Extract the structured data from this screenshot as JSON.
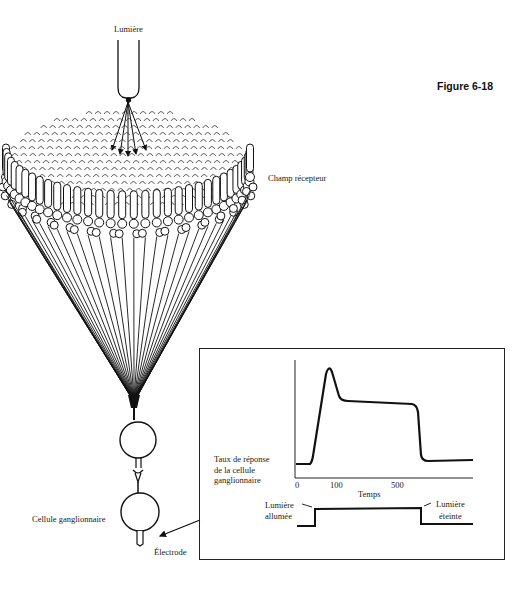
{
  "figure": {
    "number_label": "Figure 6-18"
  },
  "diagram": {
    "light_source_label": "Lumière",
    "receptive_field_label": "Champ récepteur",
    "ganglion_cell_label": "Cellule ganglionnaire",
    "electrode_label": "Électrode"
  },
  "inset_graph": {
    "y_label_lines": [
      "Taux de réponse",
      "de la cellule",
      "ganglionnaire"
    ],
    "x_label": "Temps",
    "x_ticks": [
      "0",
      "100",
      "500"
    ],
    "light_on_label_lines": [
      "Lumière",
      "allumée"
    ],
    "light_off_label_lines": [
      "Lumière",
      "éteinte"
    ]
  },
  "chart_data": {
    "type": "line",
    "title": "",
    "xlabel": "Temps",
    "ylabel": "Taux de réponse de la cellule ganglionnaire",
    "x_tick_labels": [
      "0",
      "100",
      "500"
    ],
    "grid": false,
    "series": [
      {
        "name": "Réponse de la cellule ganglionnaire",
        "x": [
          0,
          50,
          80,
          110,
          500,
          530,
          540,
          760
        ],
        "y": [
          10,
          10,
          95,
          64,
          59,
          20,
          12,
          13
        ]
      },
      {
        "name": "Stimulus lumineux",
        "x": [
          0,
          60,
          60,
          540,
          540,
          760
        ],
        "y": [
          0,
          0,
          1,
          1,
          0,
          0
        ]
      }
    ],
    "annotations": [
      "Lumière allumée",
      "Lumière éteinte"
    ]
  }
}
